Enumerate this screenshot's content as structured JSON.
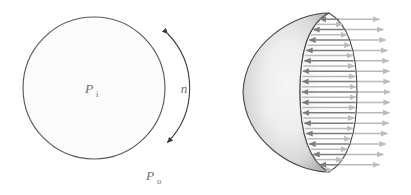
{
  "figure": {
    "caption_present": false,
    "background_color": "#ffffff",
    "panels": [
      {
        "id": "left-panel",
        "name": "pressurised-sphere-cross-section",
        "shape": "circle",
        "outline_color": "#5a5a5a",
        "fill_color": "#fbfbfb",
        "center": {
          "x": 94,
          "y": 88
        },
        "radius": 71,
        "labels": [
          {
            "name": "internal-pressure-label",
            "base": "P",
            "subscript": "i",
            "x": 89,
            "y": 93,
            "color": "#6e6e6e"
          },
          {
            "name": "external-pressure-label",
            "base": "P",
            "subscript": "o",
            "x": 150,
            "y": 180,
            "color": "#6e6e6e"
          },
          {
            "name": "wall-thickness-label",
            "base": "n",
            "subscript": "",
            "x": 184,
            "y": 93,
            "color": "#6e6e6e"
          }
        ],
        "annotations": [
          {
            "name": "thickness-extent-arc-arrow",
            "type": "double-headed-arc",
            "color": "#3c3c3c",
            "start_angle_deg": -52,
            "end_angle_deg": 52,
            "arc_radius": 78
          }
        ]
      },
      {
        "id": "right-panel",
        "name": "hemisphere-free-body-diagram",
        "shape": "hemisphere",
        "outline_color": "#4a4a4a",
        "dome_fill_light": "#f2f2f2",
        "dome_fill_dark": "#b8b8b8",
        "cut_face_fill": "#fdfdfd",
        "center": {
          "x": 300,
          "y": 92
        },
        "sphere_radius": 80,
        "cut_ellipse_rx": 29,
        "inner_arrow_color": "#7d7d7d",
        "outer_arrow_color": "#b9b9b9",
        "inner_arrow_direction": "left",
        "outer_arrow_direction": "right",
        "inner_arrow_count": 15,
        "outer_arrow_count": 15
      }
    ]
  }
}
